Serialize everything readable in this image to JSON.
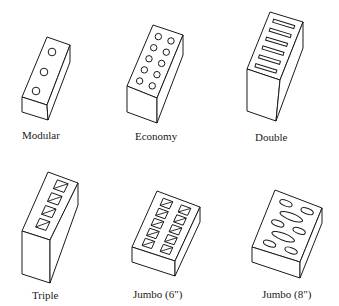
{
  "figure": {
    "bricks": [
      {
        "name": "modular",
        "label": "Modular",
        "core_type": "round",
        "core_count": 3
      },
      {
        "name": "economy",
        "label": "Economy",
        "core_type": "round",
        "core_count": 10
      },
      {
        "name": "double",
        "label": "Double",
        "core_type": "slot",
        "core_count": 6
      },
      {
        "name": "triple",
        "label": "Triple",
        "core_type": "square",
        "core_count": 4
      },
      {
        "name": "jumbo-6",
        "label": "Jumbo (6\")",
        "core_type": "square",
        "core_count": 10
      },
      {
        "name": "jumbo-8",
        "label": "Jumbo (8\")",
        "core_type": "oval",
        "core_count": 8
      }
    ]
  },
  "colors": {
    "ink": "#1a1a1a",
    "paper": "#ffffff"
  }
}
